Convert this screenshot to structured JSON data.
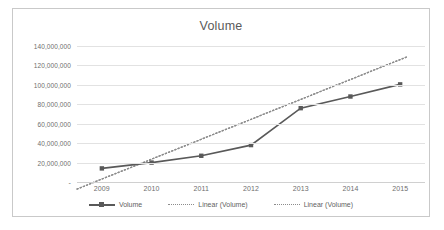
{
  "chart_data": {
    "type": "line",
    "title": "Volume",
    "xlabel": "",
    "ylabel": "",
    "x": [
      "2009",
      "2010",
      "2011",
      "2012",
      "2013",
      "2014",
      "2015"
    ],
    "categories": [
      "2009",
      "2010",
      "2011",
      "2012",
      "2013",
      "2014",
      "2015"
    ],
    "ylim": [
      0,
      140000000
    ],
    "ytick_labels": [
      "-",
      "20,000,000",
      "40,000,000",
      "60,000,000",
      "80,000,000",
      "100,000,000",
      "120,000,000",
      "140,000,000"
    ],
    "ytick_values": [
      0,
      20000000,
      40000000,
      60000000,
      80000000,
      100000000,
      120000000,
      140000000
    ],
    "grid": true,
    "legend_position": "bottom",
    "series": [
      {
        "name": "Volume",
        "style": "solid-with-markers",
        "color": "#595959",
        "values": [
          14000000,
          20000000,
          27000000,
          38000000,
          76000000,
          88000000,
          100500000
        ]
      },
      {
        "name": "Linear (Volume)",
        "style": "dotted-trendline",
        "color": "#8c8c8c",
        "values": [
          3000000,
          23500000,
          44000000,
          64500000,
          85000000,
          105500000,
          126000000
        ]
      },
      {
        "name": "Linear (Volume)",
        "style": "dotted-trendline",
        "color": "#8c8c8c",
        "values": [
          3000000,
          23500000,
          44000000,
          64500000,
          85000000,
          105500000,
          126000000
        ]
      }
    ],
    "legend": [
      "Volume",
      "Linear (Volume)",
      "Linear (Volume)"
    ]
  }
}
